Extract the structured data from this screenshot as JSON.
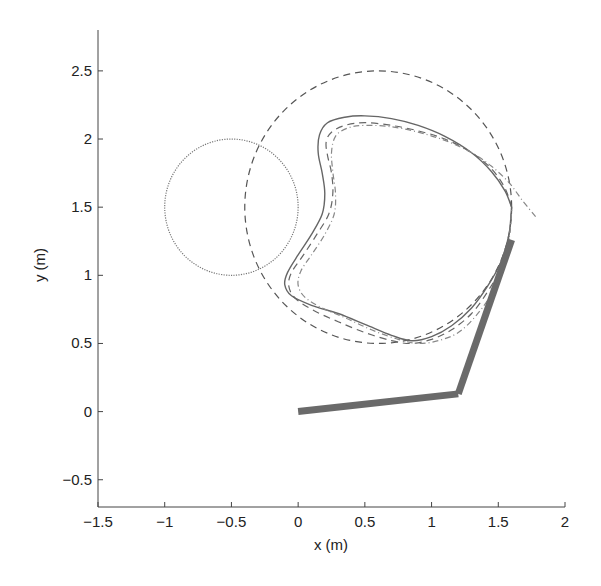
{
  "chart_data": {
    "type": "line",
    "title": "",
    "xlabel": "x (m)",
    "ylabel": "y (m)",
    "xlim": [
      -1.5,
      2.0
    ],
    "ylim": [
      -0.7,
      2.8
    ],
    "grid": false,
    "legend": "none",
    "xticks": [
      -1.5,
      -1,
      -0.5,
      0,
      0.5,
      1,
      1.5,
      2
    ],
    "xtick_labels": [
      "−1.5",
      "−1",
      "−0.5",
      "0",
      "0.5",
      "1",
      "1.5",
      "2"
    ],
    "yticks": [
      -0.5,
      0,
      0.5,
      1,
      1.5,
      2,
      2.5
    ],
    "ytick_labels": [
      "−0.5",
      "0",
      "0.5",
      "1",
      "1.5",
      "2",
      "2.5"
    ],
    "circles": [
      {
        "name": "obstacle-circle",
        "center": [
          -0.5,
          1.5
        ],
        "radius": 0.5,
        "style": "dotted",
        "color": "#777777"
      },
      {
        "name": "reference-circle",
        "center": [
          0.6,
          1.5
        ],
        "radius": 1.0,
        "style": "dashed",
        "color": "#555555"
      }
    ],
    "series": [
      {
        "name": "actual-path",
        "style": "solid",
        "color": "#666666",
        "x": [
          1.6,
          1.55,
          1.45,
          1.3,
          1.1,
          0.9,
          0.7,
          0.5,
          0.35,
          0.22,
          0.16,
          0.15,
          0.18,
          0.2,
          0.18,
          0.1,
          0.0,
          -0.08,
          -0.1,
          -0.05,
          0.1,
          0.3,
          0.5,
          0.7,
          0.85,
          1.0,
          1.15,
          1.3,
          1.42,
          1.52,
          1.58,
          1.6
        ],
        "y": [
          1.5,
          1.62,
          1.76,
          1.9,
          2.02,
          2.1,
          2.15,
          2.17,
          2.16,
          2.12,
          2.03,
          1.9,
          1.75,
          1.6,
          1.45,
          1.3,
          1.15,
          1.02,
          0.93,
          0.85,
          0.78,
          0.72,
          0.64,
          0.56,
          0.52,
          0.55,
          0.63,
          0.76,
          0.92,
          1.1,
          1.3,
          1.5
        ]
      },
      {
        "name": "desired-path",
        "style": "dashed",
        "color": "#666666",
        "x": [
          1.6,
          1.55,
          1.45,
          1.3,
          1.1,
          0.9,
          0.7,
          0.5,
          0.35,
          0.25,
          0.21,
          0.22,
          0.25,
          0.26,
          0.23,
          0.14,
          0.04,
          -0.05,
          -0.07,
          -0.02,
          0.12,
          0.3,
          0.5,
          0.7,
          0.85,
          1.0,
          1.15,
          1.3,
          1.42,
          1.52,
          1.58,
          1.6
        ],
        "y": [
          1.5,
          1.64,
          1.78,
          1.9,
          2.0,
          2.06,
          2.1,
          2.12,
          2.1,
          2.05,
          1.98,
          1.88,
          1.75,
          1.6,
          1.45,
          1.3,
          1.15,
          1.02,
          0.92,
          0.83,
          0.74,
          0.66,
          0.58,
          0.52,
          0.5,
          0.53,
          0.6,
          0.72,
          0.88,
          1.06,
          1.28,
          1.5
        ]
      },
      {
        "name": "estimated-path",
        "style": "dashdot",
        "color": "#888888",
        "x": [
          1.78,
          1.68,
          1.58,
          1.45,
          1.3,
          1.1,
          0.9,
          0.7,
          0.5,
          0.37,
          0.28,
          0.25,
          0.26,
          0.28,
          0.27,
          0.2,
          0.1,
          0.02,
          0.0,
          0.05,
          0.18,
          0.35,
          0.55,
          0.75,
          0.9,
          1.05,
          1.2,
          1.33,
          1.44,
          1.53,
          1.58,
          1.6
        ],
        "y": [
          1.43,
          1.55,
          1.68,
          1.8,
          1.9,
          1.99,
          2.05,
          2.09,
          2.1,
          2.08,
          2.02,
          1.9,
          1.76,
          1.6,
          1.45,
          1.3,
          1.15,
          1.03,
          0.93,
          0.84,
          0.76,
          0.69,
          0.6,
          0.53,
          0.5,
          0.52,
          0.58,
          0.7,
          0.85,
          1.04,
          1.26,
          1.48
        ]
      }
    ],
    "robot_arm": {
      "name": "two-link-arm",
      "color": "#6a6a6a",
      "joints": [
        [
          0.0,
          0.0
        ],
        [
          1.2,
          0.13
        ],
        [
          1.6,
          1.26
        ]
      ]
    }
  }
}
